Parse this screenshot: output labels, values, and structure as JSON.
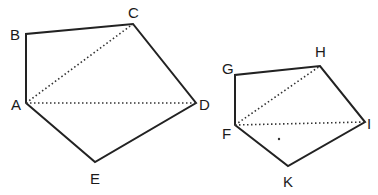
{
  "colors": {
    "line": "#222222",
    "background": "#ffffff"
  },
  "figures": [
    {
      "name": "pentagon-ABCDE",
      "vertices": [
        {
          "label": "A",
          "x": 26,
          "y": 103,
          "lx": 11,
          "ly": 110
        },
        {
          "label": "B",
          "x": 26,
          "y": 34,
          "lx": 10,
          "ly": 40
        },
        {
          "label": "C",
          "x": 133,
          "y": 24,
          "lx": 128,
          "ly": 18
        },
        {
          "label": "D",
          "x": 196,
          "y": 103,
          "lx": 199,
          "ly": 110
        },
        {
          "label": "E",
          "x": 95,
          "y": 162,
          "lx": 90,
          "ly": 183
        }
      ],
      "diagonals": [
        [
          "A",
          "C"
        ],
        [
          "A",
          "D"
        ]
      ]
    },
    {
      "name": "pentagon-FGHIK",
      "vertices": [
        {
          "label": "F",
          "x": 235,
          "y": 125,
          "lx": 222,
          "ly": 138
        },
        {
          "label": "G",
          "x": 235,
          "y": 75,
          "lx": 222,
          "ly": 74
        },
        {
          "label": "H",
          "x": 320,
          "y": 66,
          "lx": 316,
          "ly": 57
        },
        {
          "label": "I",
          "x": 365,
          "y": 122,
          "lx": 367,
          "ly": 129
        },
        {
          "label": "K",
          "x": 288,
          "y": 166,
          "lx": 283,
          "ly": 186
        }
      ],
      "diagonals": [
        [
          "F",
          "H"
        ],
        [
          "F",
          "I"
        ]
      ]
    }
  ],
  "labels": {
    "A": "A",
    "B": "B",
    "C": "C",
    "D": "D",
    "E": "E",
    "F": "F",
    "G": "G",
    "H": "H",
    "I": "I",
    "K": "K"
  }
}
